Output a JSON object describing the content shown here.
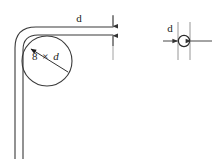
{
  "diagram": {
    "stroke_color": "#3a3a3a",
    "dimension_color": "#555555",
    "background": "#ffffff",
    "views": {
      "bend_view": {
        "name": "bent-wire-side-view",
        "bend_radius_label": "8 × d",
        "bend_radius_value": "8",
        "bend_radius_unit": "d",
        "wire_thickness_label": "d"
      },
      "section_view": {
        "name": "wire-cross-section-view",
        "diameter_label": "d"
      }
    }
  },
  "labels": {
    "bend_radius": "8 × d",
    "bend_radius_number": "8",
    "bend_radius_times": "×",
    "bend_radius_symbol": "d",
    "wire_diameter_top": "d",
    "wire_diameter_section": "d"
  }
}
